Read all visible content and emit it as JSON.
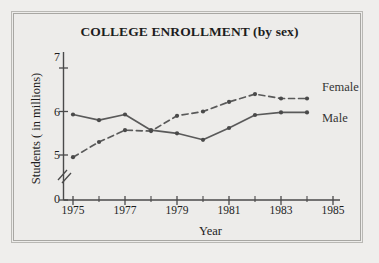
{
  "figure": {
    "background_color": "#efeeec",
    "border_color": "#a8a7a3"
  },
  "chart_data": {
    "type": "line",
    "title": "COLLEGE ENROLLMENT (by sex)",
    "xlabel": "Year",
    "ylabel": "Students ( in millions)",
    "x": [
      1975,
      1976,
      1977,
      1978,
      1979,
      1980,
      1981,
      1982,
      1983,
      1984
    ],
    "xlim": [
      1974.4,
      1985.6
    ],
    "ylim": [
      0,
      7.25
    ],
    "y_axis_break": true,
    "y_break_between": [
      0,
      5
    ],
    "ytick_labels": [
      "0",
      "5",
      "6",
      "7"
    ],
    "ytick_values": [
      0,
      5,
      6,
      7
    ],
    "xtick_labels": [
      "1975",
      "1977",
      "1979",
      "1981",
      "1983",
      "1985"
    ],
    "xtick_values": [
      1975,
      1977,
      1979,
      1981,
      1983,
      1985
    ],
    "xminor_tick_values": [
      1976,
      1978,
      1980,
      1982,
      1984
    ],
    "grid": false,
    "legend_position": "line-end-right",
    "line_color": "#5a5a5a",
    "marker_color": "#4a4a4a",
    "series": [
      {
        "name": "Female",
        "style": "dashed",
        "marker": "dot",
        "color": "#5a5a5a",
        "values": [
          4.95,
          5.3,
          5.57,
          5.55,
          5.9,
          6.0,
          6.22,
          6.4,
          6.3,
          6.3
        ]
      },
      {
        "name": "Male",
        "style": "solid",
        "marker": "dot",
        "color": "#5a5a5a",
        "values": [
          5.93,
          5.8,
          5.93,
          5.57,
          5.5,
          5.35,
          5.62,
          5.92,
          5.98,
          5.98
        ]
      }
    ],
    "annotations": [
      {
        "text": "Female",
        "at_x": 1984.3,
        "at_y": 6.55
      },
      {
        "text": "Male",
        "at_x": 1984.3,
        "at_y": 5.98
      }
    ]
  }
}
